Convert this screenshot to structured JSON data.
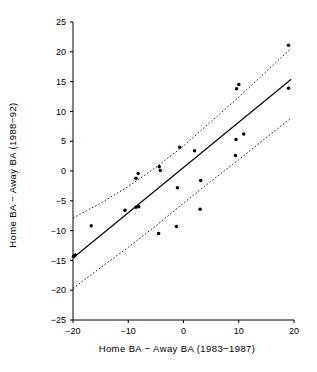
{
  "chart_data": {
    "type": "scatter",
    "title": "",
    "xlabel": "Home BA  −  Away BA  (1983−1987)",
    "ylabel": "Home BA  −  Away BA  (1988−92)",
    "xlim": [
      -20,
      20
    ],
    "ylim": [
      -25,
      25
    ],
    "xticks": [
      -20,
      -10,
      0,
      10,
      20
    ],
    "xticklabels": [
      "−20",
      "−10",
      "0",
      "10",
      "20"
    ],
    "yticks": [
      25,
      20,
      15,
      10,
      5,
      0,
      -5,
      -10,
      -15,
      -20,
      -25
    ],
    "yticklabels": [
      "25",
      "20",
      "15",
      "10",
      "5",
      "0",
      "−5",
      "−10",
      "−15",
      "−20",
      "−25"
    ],
    "grid": false,
    "legend": null,
    "points": [
      {
        "x": -19.9,
        "y": -14.3
      },
      {
        "x": -19.6,
        "y": -14.1
      },
      {
        "x": -16.7,
        "y": -9.2
      },
      {
        "x": -10.6,
        "y": -6.6
      },
      {
        "x": -8.6,
        "y": -1.2
      },
      {
        "x": -8.2,
        "y": -0.4
      },
      {
        "x": -8.6,
        "y": -6.1
      },
      {
        "x": -8.1,
        "y": -6.0
      },
      {
        "x": -4.4,
        "y": 0.7
      },
      {
        "x": -4.2,
        "y": 0.1
      },
      {
        "x": -4.5,
        "y": -10.5
      },
      {
        "x": -1.3,
        "y": -9.3
      },
      {
        "x": -1.1,
        "y": -2.8
      },
      {
        "x": -0.7,
        "y": 4.0
      },
      {
        "x": 2.0,
        "y": 3.4
      },
      {
        "x": 3.1,
        "y": -1.6
      },
      {
        "x": 3.0,
        "y": -6.4
      },
      {
        "x": 9.4,
        "y": 2.6
      },
      {
        "x": 9.5,
        "y": 5.3
      },
      {
        "x": 9.6,
        "y": 13.8
      },
      {
        "x": 10.0,
        "y": 14.5
      },
      {
        "x": 10.9,
        "y": 6.2
      },
      {
        "x": 19.0,
        "y": 21.1
      },
      {
        "x": 19.0,
        "y": 13.9
      }
    ],
    "regression_line": {
      "name": "least-squares fit",
      "style": "solid",
      "x_start": -20,
      "y_start": -14.6,
      "x_end": 19.5,
      "y_end": 15.4
    },
    "confidence_band_upper": {
      "name": "upper confidence limit",
      "style": "dotted",
      "x": [
        -20,
        -15,
        -10,
        -5,
        0,
        5,
        10,
        15,
        19.5
      ],
      "y": [
        -7.9,
        -5.4,
        -2.6,
        0.6,
        4.2,
        8.3,
        12.4,
        16.7,
        20.6
      ]
    },
    "confidence_band_lower": {
      "name": "lower confidence limit",
      "style": "dotted",
      "x": [
        -20,
        -15,
        -10,
        -5,
        0,
        5,
        10,
        15,
        19.5
      ],
      "y": [
        -19.7,
        -16.2,
        -12.8,
        -9.2,
        -5.4,
        -1.7,
        1.9,
        5.6,
        8.9
      ]
    },
    "colors": {
      "axis": "#000000",
      "point": "#000000",
      "fit": "#000000",
      "band": "#000000",
      "background": "#ffffff"
    }
  }
}
